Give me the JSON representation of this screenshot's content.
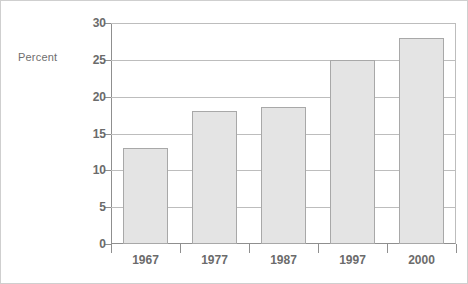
{
  "chart_data": {
    "type": "bar",
    "title": "",
    "subtitle": "",
    "xlabel": "",
    "ylabel": "Percent",
    "categories": [
      "1967",
      "1977",
      "1987",
      "1997",
      "2000"
    ],
    "values": [
      13,
      18,
      18.6,
      25,
      28
    ],
    "series": [
      {
        "name": "Percent",
        "values": [
          13,
          18,
          18.6,
          25,
          28
        ]
      }
    ],
    "ylim": [
      0,
      30
    ],
    "ytick_labels": [
      "0",
      "5",
      "10",
      "15",
      "20",
      "25",
      "30"
    ],
    "ytick_values": [
      0,
      5,
      10,
      15,
      20,
      25,
      30
    ],
    "grid": true,
    "grid_axis": "y",
    "legend": false,
    "legend_position": "none",
    "annotations": [],
    "colors": {
      "bar_fill": "#e4e4e4",
      "bar_edge": "#a8a8a8",
      "gridline": "#bdbdbd",
      "axis": "#8f8f8f",
      "text": "#6b6b6b",
      "label_text": "#6e6e6e",
      "frame": "#cfcfcf",
      "background": "#ffffff"
    }
  }
}
